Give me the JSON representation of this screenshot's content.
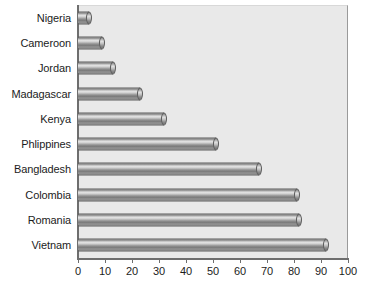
{
  "chart_data": {
    "type": "bar",
    "orientation": "horizontal",
    "title": "",
    "xlabel": "",
    "ylabel": "",
    "xlim": [
      0,
      100
    ],
    "xticks": [
      0,
      10,
      20,
      30,
      40,
      50,
      60,
      70,
      80,
      90,
      100
    ],
    "grid": false,
    "legend": false,
    "categories": [
      "Nigeria",
      "Cameroon",
      "Jordan",
      "Madagascar",
      "Kenya",
      "Phlippines",
      "Bangladesh",
      "Colombia",
      "Romania",
      "Vietnam"
    ],
    "values": [
      4,
      9,
      13,
      23,
      32,
      51,
      67,
      81,
      82,
      92
    ],
    "bars": [
      {
        "label": "Nigeria",
        "value": 4
      },
      {
        "label": "Cameroon",
        "value": 9
      },
      {
        "label": "Jordan",
        "value": 13
      },
      {
        "label": "Madagascar",
        "value": 23
      },
      {
        "label": "Kenya",
        "value": 32
      },
      {
        "label": "Phlippines",
        "value": 51
      },
      {
        "label": "Bangladesh",
        "value": 67
      },
      {
        "label": "Colombia",
        "value": 81
      },
      {
        "label": "Romania",
        "value": 82
      },
      {
        "label": "Vietnam",
        "value": 92
      }
    ],
    "colors": {
      "plot_background": "#e9e9e9",
      "page_background": "#ffffff",
      "bar_fill": "#9a9a9a",
      "bar_edge": "#5d5d5d",
      "axis": "#6e6e6e",
      "text": "#1c1c1c"
    }
  }
}
